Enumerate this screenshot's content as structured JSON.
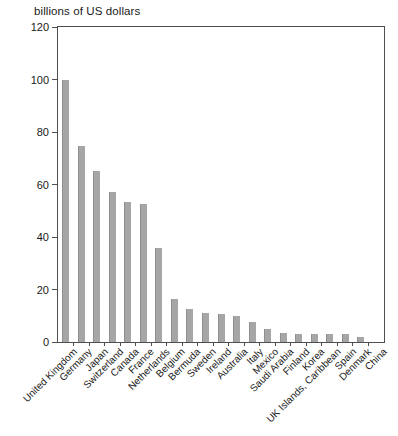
{
  "chart_data": {
    "type": "bar",
    "title": "billions of US dollars",
    "xlabel": "",
    "ylabel": "billions of US dollars",
    "categories": [
      "United Kingdom",
      "Germany",
      "Japan",
      "Switzerland",
      "Canada",
      "France",
      "Netherlands",
      "Belgium",
      "Bermuda",
      "Sweden",
      "Ireland",
      "Australia",
      "Italy",
      "Mexico",
      "Saudi Arabia",
      "Finland",
      "Korea",
      "UK Islands, Caribbean",
      "Spain",
      "Denmark",
      "China"
    ],
    "values": [
      100,
      74.5,
      65,
      57,
      53.5,
      52.5,
      36,
      16.5,
      12.5,
      11,
      10.5,
      10,
      7.5,
      5,
      3.5,
      3,
      3,
      3,
      3,
      2,
      0
    ],
    "ylim": [
      0,
      120
    ],
    "yticks": [
      0,
      20,
      40,
      60,
      80,
      100,
      120
    ],
    "grid": false,
    "legend": "none",
    "bar_color": "#a6a6a6",
    "axis_color": "#4f4f4f"
  }
}
